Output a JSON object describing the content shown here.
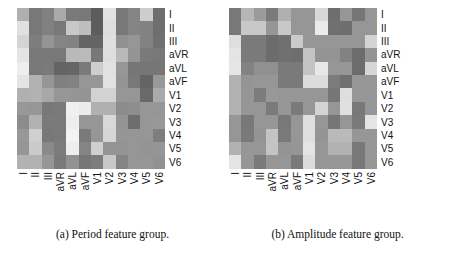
{
  "figure": {
    "kind": "two-panel-heatmap-figure",
    "background": "#ffffff",
    "panels": [
      {
        "caption": "(a) Period feature group."
      },
      {
        "caption": "(b) Amplitude feature group."
      }
    ]
  },
  "chart_data": [
    {
      "type": "heatmap",
      "title": "(a) Period feature group.",
      "xlabel": "",
      "ylabel": "",
      "grid": false,
      "legend_position": "none",
      "colormap": "gray",
      "value_range": [
        0,
        255
      ],
      "categories": [
        "I",
        "II",
        "III",
        "aVR",
        "aVL",
        "aVF",
        "V1",
        "V2",
        "V3",
        "V4",
        "V5",
        "V6"
      ],
      "row_labels": [
        "I",
        "II",
        "III",
        "aVR",
        "aVL",
        "aVF",
        "V1",
        "V2",
        "V3",
        "V4",
        "V5",
        "V6"
      ],
      "col_labels": [
        "I",
        "II",
        "III",
        "aVR",
        "aVL",
        "aVF",
        "V1",
        "V2",
        "V3",
        "V4",
        "V5",
        "V6"
      ],
      "values": [
        [
          175,
          120,
          128,
          170,
          122,
          120,
          92,
          225,
          120,
          132,
          205,
          110
        ],
        [
          225,
          120,
          128,
          120,
          200,
          190,
          92,
          222,
          120,
          132,
          130,
          110
        ],
        [
          212,
          125,
          148,
          132,
          130,
          100,
          100,
          224,
          145,
          150,
          130,
          112
        ],
        [
          228,
          120,
          120,
          120,
          185,
          186,
          120,
          222,
          185,
          148,
          122,
          120
        ],
        [
          238,
          120,
          122,
          100,
          102,
          122,
          205,
          225,
          150,
          118,
          118,
          118
        ],
        [
          228,
          178,
          150,
          128,
          130,
          150,
          150,
          226,
          148,
          120,
          100,
          152
        ],
        [
          176,
          178,
          168,
          150,
          150,
          148,
          210,
          210,
          150,
          150,
          105,
          170
        ],
        [
          152,
          150,
          120,
          122,
          240,
          235,
          176,
          176,
          140,
          142,
          150,
          150
        ],
        [
          140,
          178,
          122,
          122,
          238,
          150,
          150,
          216,
          148,
          110,
          150,
          152
        ],
        [
          152,
          208,
          120,
          122,
          243,
          122,
          150,
          214,
          150,
          150,
          150,
          126
        ],
        [
          150,
          202,
          138,
          124,
          238,
          132,
          208,
          148,
          148,
          150,
          148,
          150
        ],
        [
          178,
          178,
          150,
          122,
          146,
          118,
          124,
          200,
          132,
          150,
          150,
          146
        ]
      ]
    },
    {
      "type": "heatmap",
      "title": "(b) Amplitude feature group.",
      "xlabel": "",
      "ylabel": "",
      "grid": false,
      "legend_position": "none",
      "colormap": "gray",
      "value_range": [
        0,
        255
      ],
      "categories": [
        "I",
        "II",
        "III",
        "aVR",
        "aVL",
        "aVF",
        "V1",
        "V2",
        "V3",
        "V4",
        "V5",
        "V6"
      ],
      "row_labels": [
        "I",
        "II",
        "III",
        "aVR",
        "aVL",
        "aVF",
        "V1",
        "V2",
        "V3",
        "V4",
        "V5",
        "V6"
      ],
      "col_labels": [
        "I",
        "II",
        "III",
        "aVR",
        "aVL",
        "aVF",
        "V1",
        "V2",
        "V3",
        "V4",
        "V5",
        "V6"
      ],
      "values": [
        [
          120,
          182,
          155,
          122,
          176,
          150,
          150,
          215,
          110,
          150,
          118,
          150
        ],
        [
          120,
          200,
          200,
          150,
          200,
          150,
          150,
          235,
          112,
          110,
          150,
          150
        ],
        [
          222,
          122,
          122,
          108,
          112,
          202,
          150,
          150,
          150,
          150,
          150,
          212
        ],
        [
          228,
          122,
          122,
          108,
          112,
          110,
          196,
          148,
          148,
          130,
          108,
          148
        ],
        [
          230,
          130,
          144,
          144,
          122,
          122,
          196,
          232,
          150,
          150,
          108,
          214
        ],
        [
          178,
          148,
          150,
          150,
          122,
          122,
          220,
          220,
          124,
          112,
          150,
          150
        ],
        [
          178,
          150,
          124,
          152,
          150,
          150,
          150,
          150,
          118,
          222,
          150,
          150
        ],
        [
          178,
          150,
          150,
          122,
          150,
          122,
          150,
          212,
          150,
          224,
          120,
          150
        ],
        [
          150,
          120,
          150,
          150,
          120,
          150,
          222,
          150,
          118,
          150,
          122,
          228
        ],
        [
          150,
          122,
          148,
          196,
          122,
          150,
          222,
          148,
          186,
          186,
          150,
          150
        ],
        [
          178,
          150,
          150,
          196,
          148,
          150,
          228,
          150,
          178,
          178,
          120,
          150
        ],
        [
          228,
          150,
          122,
          150,
          150,
          122,
          220,
          150,
          150,
          150,
          120,
          150
        ]
      ]
    }
  ]
}
